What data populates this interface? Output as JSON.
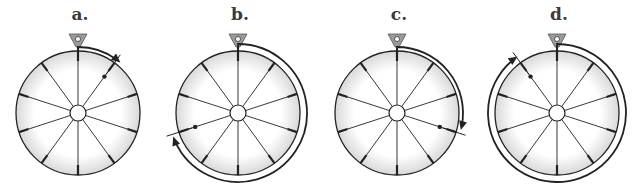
{
  "figure": {
    "panels": [
      {
        "label": "a.",
        "cx": 78,
        "arrow": {
          "start_deg": 0,
          "end_deg": 40,
          "direction": "clockwise"
        },
        "marker_deg": 36
      },
      {
        "label": "b.",
        "cx": 238,
        "arrow": {
          "start_deg": 0,
          "end_deg": 250,
          "direction": "clockwise"
        },
        "marker_deg": 252
      },
      {
        "label": "c.",
        "cx": 397,
        "arrow": {
          "start_deg": 0,
          "end_deg": 105,
          "direction": "clockwise"
        },
        "marker_deg": 108
      },
      {
        "label": "d.",
        "cx": 557,
        "arrow": {
          "start_deg": 0,
          "end_deg": 325,
          "direction": "clockwise"
        },
        "marker_deg": 324
      }
    ],
    "wheel": {
      "spokes": 10,
      "radius": 62,
      "cy": 113
    },
    "colors": {
      "stroke": "#222222",
      "rim": "#e6e6e6",
      "face": "#f7f7f7",
      "pointer": "#9a9a9a"
    }
  }
}
